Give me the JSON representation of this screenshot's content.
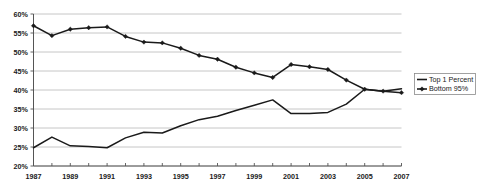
{
  "chart_data": {
    "type": "line",
    "title": "",
    "subtitle": "",
    "xlabel": "",
    "ylabel": "",
    "x": [
      1987,
      1988,
      1989,
      1990,
      1991,
      1992,
      1993,
      1994,
      1995,
      1996,
      1997,
      1998,
      1999,
      2000,
      2001,
      2002,
      2003,
      2004,
      2005,
      2006,
      2007
    ],
    "xlim": [
      1987,
      2007
    ],
    "ylim": [
      20,
      60
    ],
    "y_tick_labels": [
      "20%",
      "25%",
      "30%",
      "35%",
      "40%",
      "45%",
      "50%",
      "55%",
      "60%"
    ],
    "y_tick_values": [
      20,
      25,
      30,
      35,
      40,
      45,
      50,
      55,
      60
    ],
    "x_tick_labels": [
      "1987",
      "1989",
      "1991",
      "1993",
      "1995",
      "1997",
      "1999",
      "2001",
      "2003",
      "2005",
      "2007"
    ],
    "x_tick_values": [
      1987,
      1989,
      1991,
      1993,
      1995,
      1997,
      1999,
      2001,
      2003,
      2005,
      2007
    ],
    "grid": true,
    "legend_position": "right",
    "series": [
      {
        "name": "Top 1 Percent",
        "marker": "none",
        "color": "#1a1a1a",
        "values": [
          24.8,
          27.6,
          25.3,
          25.1,
          24.8,
          27.4,
          28.9,
          28.7,
          30.6,
          32.2,
          33.1,
          34.6,
          36.0,
          37.4,
          33.8,
          33.8,
          34.1,
          36.3,
          40.2,
          39.7,
          40.3
        ]
      },
      {
        "name": "Bottom 95%",
        "marker": "diamond",
        "color": "#1a1a1a",
        "values": [
          56.9,
          54.3,
          56.0,
          56.4,
          56.6,
          54.1,
          52.6,
          52.4,
          51.0,
          49.1,
          48.1,
          46.0,
          44.5,
          43.3,
          46.7,
          46.1,
          45.4,
          42.6,
          40.2,
          39.7,
          39.3
        ]
      }
    ]
  },
  "legend": {
    "entries": [
      {
        "label": "Top 1 Percent"
      },
      {
        "label": "Bottom 95%"
      }
    ]
  }
}
